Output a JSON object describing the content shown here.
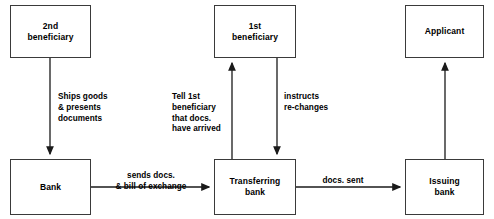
{
  "diagram": {
    "background_color": "#ffffff",
    "stroke_color": "#3a3a3a",
    "arrow_color": "#1a1a1a",
    "text_color": "#000000",
    "nodes": [
      {
        "id": "second-beneficiary",
        "label": "2nd\nbeneficiary",
        "x": 10,
        "y": 5,
        "w": 81,
        "h": 53
      },
      {
        "id": "first-beneficiary",
        "label": "1st\nbeneficiary",
        "x": 214,
        "y": 5,
        "w": 82,
        "h": 53
      },
      {
        "id": "applicant",
        "label": "Applicant",
        "x": 405,
        "y": 5,
        "w": 79,
        "h": 53
      },
      {
        "id": "bank",
        "label": "Bank",
        "x": 10,
        "y": 159,
        "w": 81,
        "h": 56
      },
      {
        "id": "transferring-bank",
        "label": "Transferring\nbank",
        "x": 214,
        "y": 159,
        "w": 82,
        "h": 56
      },
      {
        "id": "issuing-bank",
        "label": "Issuing\nbank",
        "x": 405,
        "y": 159,
        "w": 79,
        "h": 56
      }
    ],
    "edges": [
      {
        "id": "ships-goods",
        "label": "Ships goods\n& presents\ndocuments",
        "from": "second-beneficiary",
        "to": "bank",
        "direction": "down",
        "label_x": 58,
        "label_y": 92,
        "label_align": "left"
      },
      {
        "id": "tell-first-beneficiary",
        "label": "Tell 1st\nbeneficiary\nthat docs.\nhave arrived",
        "from": "transferring-bank",
        "to": "first-beneficiary",
        "direction": "up",
        "label_x": 172,
        "label_y": 92,
        "label_align": "left"
      },
      {
        "id": "instructs-re-changes",
        "label": "instructs\nre-changes",
        "from": "first-beneficiary",
        "to": "transferring-bank",
        "direction": "down",
        "label_x": 284,
        "label_y": 92,
        "label_align": "left"
      },
      {
        "id": "issuing-to-applicant",
        "label": "",
        "from": "issuing-bank",
        "to": "applicant",
        "direction": "up",
        "label_x": 0,
        "label_y": 0,
        "label_align": "center"
      },
      {
        "id": "sends-docs",
        "label": "sends docs.\n& bill of exchange",
        "from": "bank",
        "to": "transferring-bank",
        "direction": "right",
        "label_x": 99,
        "label_y": 171,
        "label_align": "center"
      },
      {
        "id": "docs-sent",
        "label": "docs. sent",
        "from": "transferring-bank",
        "to": "issuing-bank",
        "direction": "right",
        "label_x": 322,
        "label_y": 176,
        "label_align": "center"
      }
    ]
  }
}
